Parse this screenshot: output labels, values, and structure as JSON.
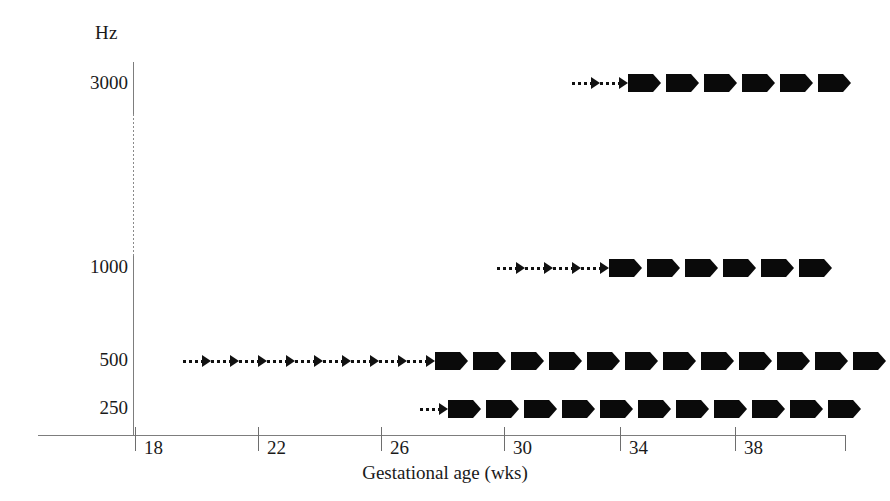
{
  "chart_data": {
    "type": "bar",
    "title": "",
    "subtitle": "",
    "xlabel": "Gestational age (wks)",
    "ylabel": "Hz",
    "x": [
      18,
      22,
      26,
      30,
      34,
      38
    ],
    "xticklabels": [
      "18",
      "22",
      "26",
      "30",
      "34",
      "38"
    ],
    "xlim": [
      14.8,
      41.9
    ],
    "categories": [
      "3000",
      "1000",
      "500",
      "250"
    ],
    "yticklabels": [
      "3000",
      "1000",
      "500",
      "250"
    ],
    "grid": false,
    "legend": null,
    "axis_break": {
      "axis": "y",
      "between": [
        "3000",
        "1000"
      ],
      "style": "dotted"
    },
    "marker_legend": {
      "dotted_arrow": "emerging response (dotted arrow)",
      "solid_arrow": "established response (solid block arrow)"
    },
    "series": [
      {
        "name": "3000",
        "label": "3000",
        "start_week": 31.3,
        "dotted_count": 2,
        "solid_count": 6,
        "dotted_span_weeks": [
          31.3,
          33.2
        ],
        "solid_span_weeks": [
          33.2,
          41.4
        ]
      },
      {
        "name": "1000",
        "label": "1000",
        "start_week": 28.8,
        "dotted_count": 4,
        "solid_count": 6,
        "dotted_span_weeks": [
          28.8,
          32.5
        ],
        "solid_span_weeks": [
          32.5,
          41.4
        ]
      },
      {
        "name": "500",
        "label": "500",
        "start_week": 19.4,
        "dotted_count": 9,
        "solid_count": 12,
        "dotted_span_weeks": [
          19.4,
          27.7
        ],
        "solid_span_weeks": [
          27.7,
          41.4
        ]
      },
      {
        "name": "250",
        "label": "250",
        "start_week": 26.7,
        "dotted_count": 1,
        "solid_count": 11,
        "dotted_span_weeks": [
          26.7,
          27.7
        ],
        "solid_span_weeks": [
          27.7,
          41.4
        ]
      }
    ]
  },
  "axes": {
    "y_unit_label": "Hz",
    "x_title": "Gestational age (wks)",
    "y_ticks": [
      {
        "label": "3000",
        "top": 83
      },
      {
        "label": "1000",
        "top": 267
      },
      {
        "label": "500",
        "top": 360
      },
      {
        "label": "250",
        "top": 408
      }
    ],
    "x_ticks": [
      {
        "label": "18",
        "left": 135
      },
      {
        "label": "22",
        "left": 258
      },
      {
        "label": "26",
        "left": 381
      },
      {
        "label": "30",
        "left": 504
      },
      {
        "label": "34",
        "left": 620
      },
      {
        "label": "38",
        "left": 735
      }
    ]
  },
  "rows": [
    {
      "key": "r3000",
      "left": 572,
      "top": 70,
      "dotted": 2,
      "solid": 6
    },
    {
      "key": "r1000",
      "left": 497,
      "top": 255,
      "dotted": 4,
      "solid": 6
    },
    {
      "key": "r500",
      "left": 183,
      "top": 348,
      "dotted": 9,
      "solid": 12
    },
    {
      "key": "r250",
      "left": 420,
      "top": 396,
      "dotted": 1,
      "solid": 11
    }
  ]
}
